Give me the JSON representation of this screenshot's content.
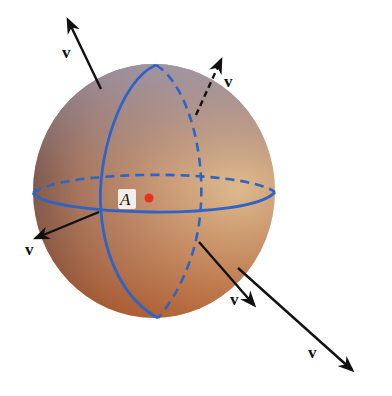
{
  "diagram": {
    "sphere": {
      "center": [
        154,
        191
      ],
      "rx": 121,
      "ry": 127,
      "colors": {
        "top_left": "#8f8aa0",
        "mid": "#b07a5a",
        "bottom": "#a3461a",
        "right": "#f0c081"
      }
    },
    "circles": {
      "color": "#2f63c6",
      "equator_label": "equator",
      "meridian_label": "meridian"
    },
    "point": {
      "label": "A",
      "color": "#e8321e"
    },
    "vectors": [
      {
        "label": "v",
        "from": [
          101,
          89
        ],
        "to": [
          68,
          20
        ],
        "dashed": false
      },
      {
        "label": "v",
        "from": [
          196,
          115
        ],
        "to": [
          221,
          60
        ],
        "dashed": true
      },
      {
        "label": "v",
        "from": [
          99,
          212
        ],
        "to": [
          36,
          238
        ],
        "dashed": false
      },
      {
        "label": "v",
        "from": [
          199,
          242
        ],
        "to": [
          254,
          305
        ],
        "dashed": false
      },
      {
        "label": "v",
        "from": [
          238,
          268
        ],
        "to": [
          352,
          370
        ],
        "dashed": false
      }
    ]
  }
}
